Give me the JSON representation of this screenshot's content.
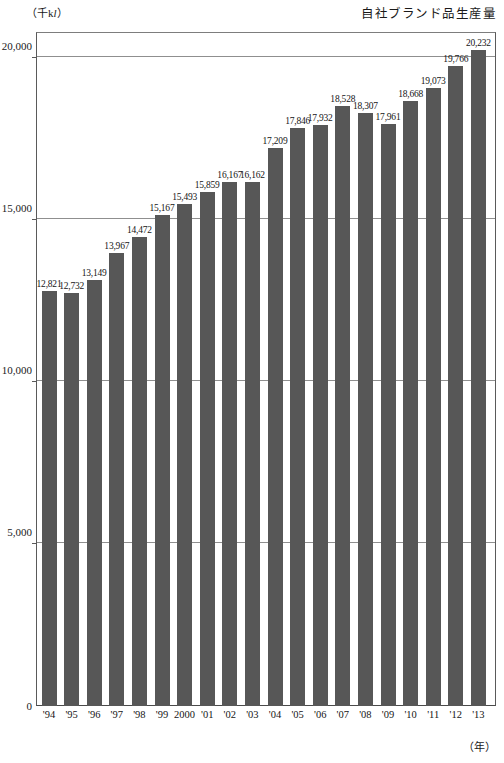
{
  "header": {
    "unit_label_prefix": "（千k",
    "unit_label_italic": "l",
    "unit_label_suffix": "）",
    "title": "自社ブランド品生産量"
  },
  "axis": {
    "x_title": "（年）",
    "y_tick_labels": [
      "20,000",
      "15,000",
      "10,000",
      "5,000",
      "0"
    ],
    "zero_label": "0"
  },
  "chart_data": {
    "type": "bar",
    "title": "自社ブランド品生産量",
    "xlabel": "（年）",
    "ylabel": "（千kl）",
    "ylim": [
      0,
      20800
    ],
    "yticks": [
      0,
      5000,
      10000,
      15000,
      20000
    ],
    "grid": true,
    "legend": "none",
    "bar_color": "#575757",
    "categories": [
      "'94",
      "'95",
      "'96",
      "'97",
      "'98",
      "'99",
      "2000",
      "'01",
      "'02",
      "'03",
      "'04",
      "'05",
      "'06",
      "'07",
      "'08",
      "'09",
      "'10",
      "'11",
      "'12",
      "'13"
    ],
    "values": [
      12821,
      12732,
      13149,
      13967,
      14472,
      15167,
      15493,
      15859,
      16167,
      16162,
      17209,
      17846,
      17932,
      18528,
      18307,
      17961,
      18668,
      19073,
      19766,
      20232
    ],
    "value_labels": [
      "12,821",
      "12,732",
      "13,149",
      "13,967",
      "14,472",
      "15,167",
      "15,493",
      "15,859",
      "16,167",
      "16,162",
      "17,209",
      "17,846",
      "17,932",
      "18,528",
      "18,307",
      "17,961",
      "18,668",
      "19,073",
      "19,766",
      "20,232"
    ]
  }
}
